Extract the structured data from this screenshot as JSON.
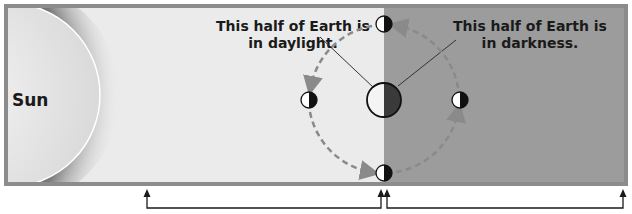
{
  "diagram": {
    "sun_label": "Sun",
    "daylight_label_line1": "This half of Earth is",
    "daylight_label_line2": "in daylight.",
    "darkness_label_line1": "This half of Earth is",
    "darkness_label_line2": "in darkness.",
    "colors": {
      "frame": "#8c8c8c",
      "day_side": "#ebebeb",
      "night_side": "#9c9c9c",
      "orbit_arrow": "#8a8a8a",
      "earth_dark": "#3a3a3a",
      "bracket_line": "#1a1a1a"
    },
    "orbit_positions": [
      "top",
      "left",
      "bottom",
      "right"
    ]
  }
}
